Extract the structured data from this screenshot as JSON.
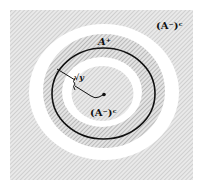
{
  "diagram": {
    "labels": {
      "outer_complement": "(A⁻)ᶜ",
      "inner_complement": "(A⁻)ᶜ",
      "a_plus": "A⁺",
      "radius": "√y"
    },
    "regions": [
      {
        "name": "outer-complement-region",
        "fill": "hatched-light-gray"
      },
      {
        "name": "white-gap-ring-outer",
        "fill": "#ffffff"
      },
      {
        "name": "a-plus-hatched-ring",
        "fill": "hatched-gray"
      },
      {
        "name": "white-gap-ring-inner",
        "fill": "#ffffff"
      },
      {
        "name": "inner-complement-disk",
        "fill": "hatched-light-gray"
      }
    ],
    "colors": {
      "hatch_light_bg": "#e9e9e9",
      "hatch_light_line": "#c4c4c4",
      "hatch_ring_bg": "#e2e2e2",
      "hatch_ring_line": "#9a9a9a",
      "stroke": "#111111"
    }
  }
}
